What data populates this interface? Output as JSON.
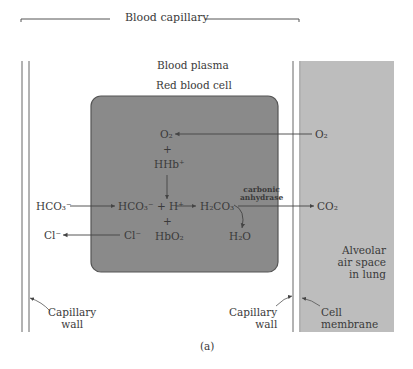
{
  "diagram": {
    "title_top": "Blood capillary",
    "region_plasma": "Blood plasma",
    "region_cell": "Red blood cell",
    "region_alveolar": [
      "Alveolar",
      "air space",
      "in lung"
    ],
    "caption": "(a)",
    "labels": {
      "capillary_wall_left": [
        "Capillary",
        "wall"
      ],
      "capillary_wall_right": [
        "Capillary",
        "wall"
      ],
      "cell_membrane": [
        "Cell",
        "membrane"
      ]
    },
    "species": {
      "o2_cell": "O₂",
      "o2_lung": "O₂",
      "plus1": "+",
      "hhb": "HHb⁺",
      "hco3_plasma": "HCO₃⁻",
      "hco3_cell": "HCO₃⁻ + H⁺",
      "h2co3": "H₂CO₃",
      "enzyme": [
        "carbonic",
        "anhydrase"
      ],
      "co2_lung": "CO₂",
      "plus2": "+",
      "cl_plasma": "Cl⁻",
      "cl_cell": "Cl⁻",
      "hbo2": "HbO₂",
      "h2o": "H₂O"
    },
    "colors": {
      "red_blood_cell_fill": "#8a8a8a",
      "alveolar_fill": "#bdbdbd",
      "line": "#555555"
    }
  }
}
